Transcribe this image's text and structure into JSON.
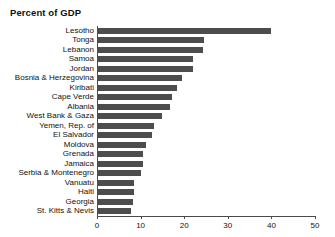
{
  "chart_data": {
    "type": "bar",
    "orientation": "horizontal",
    "title": "Percent of GDP",
    "xlabel": "",
    "ylabel": "",
    "xlim": [
      0,
      50
    ],
    "xticks": [
      0,
      10,
      20,
      30,
      40,
      50
    ],
    "xtick_labels": [
      "0",
      "10",
      "20",
      "30",
      "40",
      "50"
    ],
    "grid": false,
    "legend": null,
    "bar_color": "#4d4d4d",
    "axis_color": "#4a4a4a",
    "categories": [
      "Lesotho",
      "Tonga",
      "Lebanon",
      "Samoa",
      "Jordan",
      "Bosnia & Herzegovina",
      "Kiribati",
      "Cape Verde",
      "Albania",
      "West Bank & Gaza",
      "Yemen, Rep. of",
      "El Salvador",
      "Moldova",
      "Grenada",
      "Jamaica",
      "Serbia & Montenegro",
      "Vanuatu",
      "Haiti",
      "Georgia",
      "St. Kitts & Nevis"
    ],
    "values": [
      39.8,
      24.6,
      24.4,
      22.1,
      22.0,
      19.5,
      18.4,
      17.2,
      16.8,
      14.9,
      13.1,
      12.7,
      11.3,
      10.6,
      10.5,
      10.2,
      8.6,
      8.4,
      8.2,
      7.7
    ]
  }
}
